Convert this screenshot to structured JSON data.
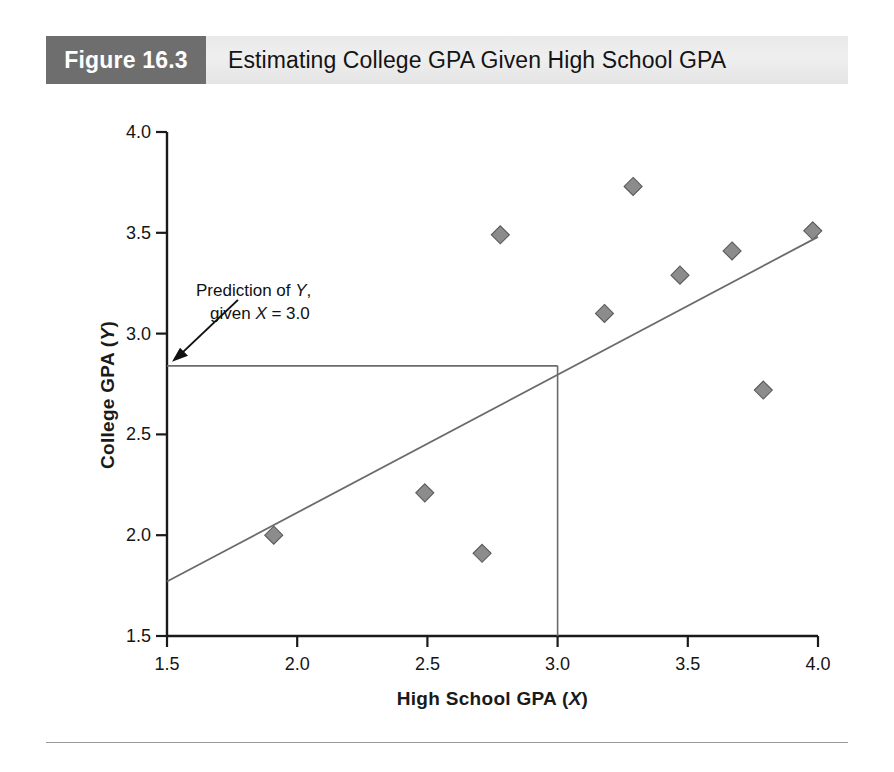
{
  "figure": {
    "badge": "Figure 16.3",
    "title": "Estimating College GPA Given High School GPA"
  },
  "colors": {
    "badge_background": "#6e6e6e",
    "title_background": "#e9e9e9",
    "marker_fill": "#8c8c8c",
    "marker_stroke": "#5a5a5a",
    "axis": "#1a1a1a",
    "regression_line": "#6b6b6b",
    "prediction_line": "#6b6b6b"
  },
  "annotation": {
    "line1_prefix": "Prediction of ",
    "line1_var": "Y",
    "line1_suffix": ",",
    "line2_prefix": "given ",
    "line2_var": "X",
    "line2_suffix": " = 3.0"
  },
  "axis_labels": {
    "y_prefix": "College GPA (",
    "y_var": "Y",
    "y_suffix": ")",
    "x_prefix": "High School GPA (",
    "x_var": "X",
    "x_suffix": ")"
  },
  "chart_data": {
    "type": "scatter",
    "title": "Estimating College GPA Given High School GPA",
    "xlabel": "High School GPA (X)",
    "ylabel": "College GPA (Y)",
    "xlim": [
      1.5,
      4.0
    ],
    "ylim": [
      1.5,
      4.0
    ],
    "xticks": [
      1.5,
      2.0,
      2.5,
      3.0,
      3.5,
      4.0
    ],
    "yticks": [
      1.5,
      2.0,
      2.5,
      3.0,
      3.5,
      4.0
    ],
    "xtick_labels": [
      "1.5",
      "2.0",
      "2.5",
      "3.0",
      "3.5",
      "4.0"
    ],
    "ytick_labels": [
      "1.5",
      "2.0",
      "2.5",
      "3.0",
      "3.5",
      "4.0"
    ],
    "grid": false,
    "legend": false,
    "marker": "diamond",
    "points": [
      {
        "x": 1.91,
        "y": 2.0
      },
      {
        "x": 2.49,
        "y": 2.21
      },
      {
        "x": 2.71,
        "y": 1.91
      },
      {
        "x": 2.78,
        "y": 3.49
      },
      {
        "x": 3.18,
        "y": 3.1
      },
      {
        "x": 3.29,
        "y": 3.73
      },
      {
        "x": 3.47,
        "y": 3.29
      },
      {
        "x": 3.67,
        "y": 3.41
      },
      {
        "x": 3.79,
        "y": 2.72
      },
      {
        "x": 3.98,
        "y": 3.51
      }
    ],
    "regression_line": {
      "x_start": 1.5,
      "y_start": 1.77,
      "x_end": 4.0,
      "y_end": 3.48,
      "slope": 0.684,
      "intercept": 0.744
    },
    "prediction": {
      "x_value": 3.0,
      "y_value": 2.84,
      "horizontal_from_x": 1.5,
      "vertical_to_y": 1.5
    }
  }
}
